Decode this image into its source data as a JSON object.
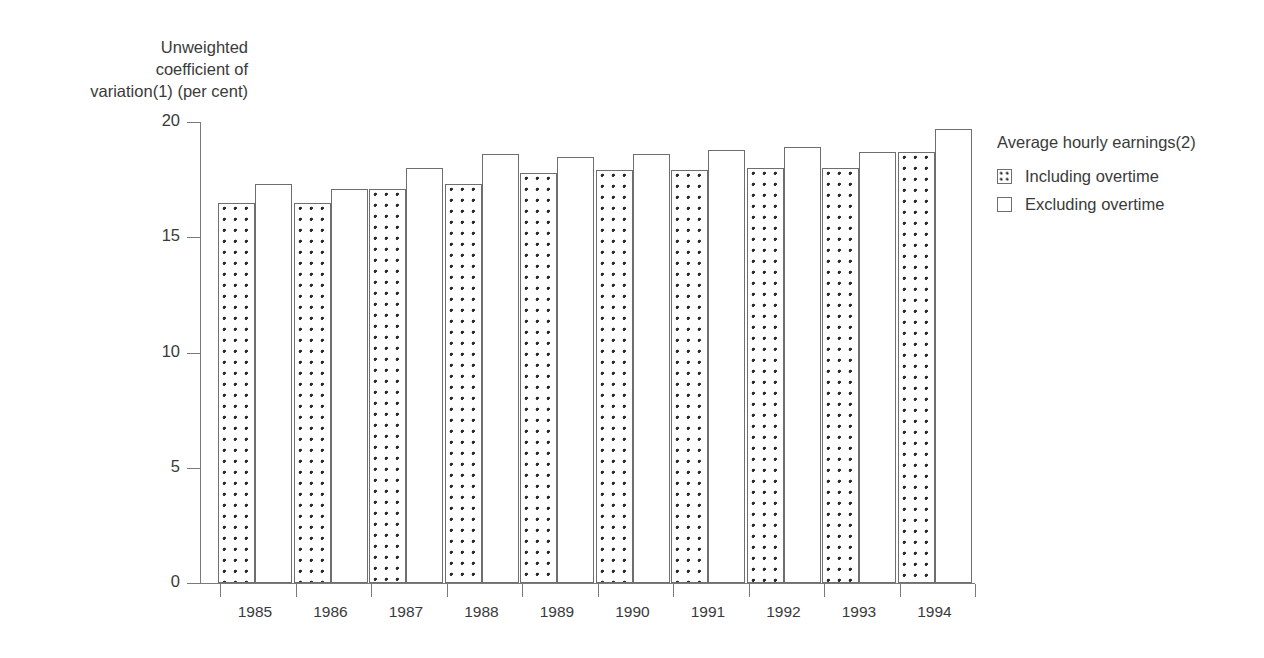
{
  "chart_data": {
    "type": "bar",
    "title": "",
    "subtitle": "",
    "xlabel": "",
    "ylabel": "Unweighted\ncoefficient of\nvariation(1) (per cent)",
    "categories": [
      "1985",
      "1986",
      "1987",
      "1988",
      "1989",
      "1990",
      "1991",
      "1992",
      "1993",
      "1994"
    ],
    "series": [
      {
        "name": "Including overtime",
        "fill": "dotted",
        "values": [
          16.5,
          16.5,
          17.1,
          17.3,
          17.8,
          17.9,
          17.9,
          18.0,
          18.0,
          18.7
        ]
      },
      {
        "name": "Excluding overtime",
        "fill": "white",
        "values": [
          17.3,
          17.1,
          18.0,
          18.6,
          18.5,
          18.6,
          18.8,
          18.9,
          18.7,
          19.7
        ]
      }
    ],
    "ylim": [
      0,
      20
    ],
    "yticks": [
      0,
      5,
      10,
      15,
      20
    ],
    "ytick_labels": [
      "0",
      "5",
      "10",
      "15",
      "20"
    ],
    "grid": false,
    "legend_position": "right",
    "legend_title": "Average hourly earnings(2)",
    "colors": {
      "axis": "#7a7a7a",
      "bar_outline": "#6e6e6e",
      "dot": "#2b2b2b",
      "text": "#3a3a3a",
      "background": "#ffffff"
    }
  },
  "legend": {
    "title": "Average hourly earnings(2)",
    "items": [
      {
        "label": "Including overtime"
      },
      {
        "label": "Excluding overtime"
      }
    ]
  },
  "axes": {
    "y_title": "Unweighted\ncoefficient of\nvariation(1) (per cent)",
    "y_ticks": [
      "20",
      "15",
      "10",
      "5",
      "0"
    ],
    "x_ticks": [
      "1985",
      "1986",
      "1987",
      "1988",
      "1989",
      "1990",
      "1991",
      "1992",
      "1993",
      "1994"
    ]
  }
}
